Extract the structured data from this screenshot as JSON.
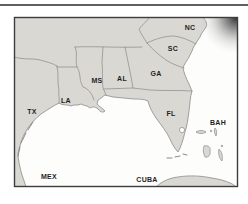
{
  "map": {
    "title": "Southeastern United States and Gulf of Mexico map",
    "labels": [
      {
        "text": "TX",
        "x": 32,
        "y": 111
      },
      {
        "text": "LA",
        "x": 66,
        "y": 100
      },
      {
        "text": "MS",
        "x": 97,
        "y": 80
      },
      {
        "text": "AL",
        "x": 122,
        "y": 78
      },
      {
        "text": "GA",
        "x": 156,
        "y": 73
      },
      {
        "text": "SC",
        "x": 173,
        "y": 48
      },
      {
        "text": "NC",
        "x": 190,
        "y": 27
      },
      {
        "text": "FL",
        "x": 171,
        "y": 113
      },
      {
        "text": "BAH",
        "x": 218,
        "y": 122
      },
      {
        "text": "MEX",
        "x": 49,
        "y": 176
      },
      {
        "text": "CUBA",
        "x": 147,
        "y": 179
      }
    ],
    "colors": {
      "land": "#d9d8d3",
      "water": "#fdfdfc",
      "boundary_line": "#8a8a8a",
      "frame": "#3d3d3d",
      "label_text": "#1f1f1f",
      "top_rule": "#606060",
      "corner_shade": "#2a2a2a"
    }
  }
}
